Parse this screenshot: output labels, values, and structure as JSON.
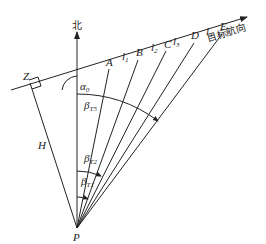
{
  "diagram": {
    "north_label": "北",
    "heading_label": "目标航向",
    "observer_label": "P",
    "perpendicular_foot_label": "Z",
    "distance_label": "H",
    "course_angle": {
      "base": "α",
      "sub": "0"
    },
    "points": [
      "A",
      "B",
      "C",
      "D",
      "E"
    ],
    "segments": [
      {
        "base": "l",
        "sub": "1"
      },
      {
        "base": "l",
        "sub": "2"
      },
      {
        "base": "l",
        "sub": "3"
      },
      {
        "base": "l",
        "sub": "4"
      }
    ],
    "bearings": [
      {
        "base": "β",
        "sub": "T5"
      },
      {
        "base": "β",
        "sub": "T2"
      },
      {
        "base": "β",
        "sub": "T1"
      }
    ]
  }
}
